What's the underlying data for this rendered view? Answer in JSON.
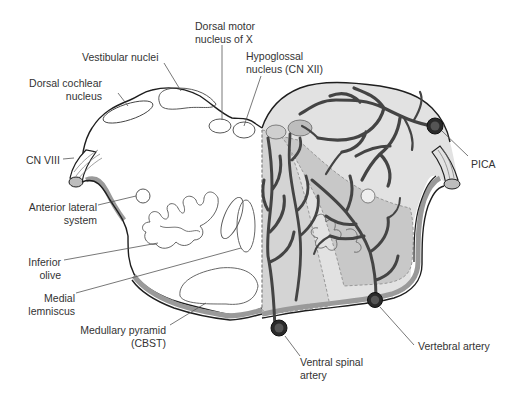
{
  "diagram": {
    "colors": {
      "outline": "#1e1e1e",
      "artery": "#444444",
      "artery_dark": "#2a2a2a",
      "territory_light": "#e2e2e2",
      "territory_mid": "#c8c8c8",
      "territory_dark": "#a8a8a8",
      "pia_band": "#9a9a9a",
      "label_text": "#333333",
      "leader_line": "#555555"
    },
    "labels": {
      "dorsal_motor_x": "Dorsal motor\nnucleus of X",
      "vestibular": "Vestibular nuclei",
      "hypoglossal": "Hypoglossal\nnucleus (CN XII)",
      "dorsal_cochlear": "Dorsal cochlear\nnucleus",
      "cn_viii": "CN VIII",
      "pica": "PICA",
      "anterior_lateral": "Anterior lateral\nsystem",
      "inferior_olive": "Inferior\nolive",
      "medial_lemniscus": "Medial\nlemniscus",
      "medullary_pyramid": "Medullary pyramid\n(CBST)",
      "ventral_spinal": "Ventral spinal\nartery",
      "vertebral": "Vertebral artery"
    }
  }
}
